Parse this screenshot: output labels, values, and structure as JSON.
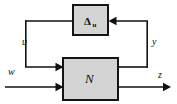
{
  "diagram": {
    "type": "block-diagram",
    "background_color": "#ffffff",
    "line_color": "#111111",
    "block_fill_color": "#d4d4d4",
    "block_border_color": "#141414",
    "blocks": [
      {
        "id": "delta-block",
        "label": "Δ",
        "subscript": "u",
        "x": 73,
        "y": 5,
        "width": 35,
        "height": 30
      },
      {
        "id": "n-block",
        "label": "N",
        "subscript": "",
        "x": 63,
        "y": 58,
        "width": 55,
        "height": 42
      }
    ],
    "signals": [
      {
        "id": "signal-u",
        "label": "u",
        "x": 22,
        "y": 45
      },
      {
        "id": "signal-y",
        "label": "y",
        "x": 152,
        "y": 45
      },
      {
        "id": "signal-w",
        "label": "w",
        "x": 8,
        "y": 75
      },
      {
        "id": "signal-z",
        "label": "z",
        "x": 158,
        "y": 78
      }
    ]
  }
}
